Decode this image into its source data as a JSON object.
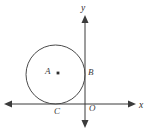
{
  "figure": {
    "type": "geometry-diagram",
    "background_color": "#ffffff",
    "stroke_color": "#4a4a4a",
    "axis_color": "#3b3b3b",
    "label_color": "#3b3b3b"
  },
  "axes": {
    "x_axis": {
      "label": "x",
      "name": "x-axis",
      "arrow_both_ends": true
    },
    "y_axis": {
      "label": "y",
      "name": "y-axis",
      "arrow_both_ends": true
    },
    "origin": {
      "label": "O"
    }
  },
  "circle": {
    "center_label": "A",
    "center_dot": true,
    "tangent_point_y_axis_label": "B",
    "tangent_point_x_axis_label": "C",
    "center_x": 55.5,
    "center_y": 74,
    "radius": 29.5
  },
  "labels": [
    {
      "text": "y",
      "name": "y-axis-label"
    },
    {
      "text": "x",
      "name": "x-axis-label"
    },
    {
      "text": "A",
      "name": "circle-center-label"
    },
    {
      "text": "B",
      "name": "tangent-point-b-label"
    },
    {
      "text": "C",
      "name": "tangent-point-c-label"
    },
    {
      "text": "O",
      "name": "origin-label"
    }
  ]
}
